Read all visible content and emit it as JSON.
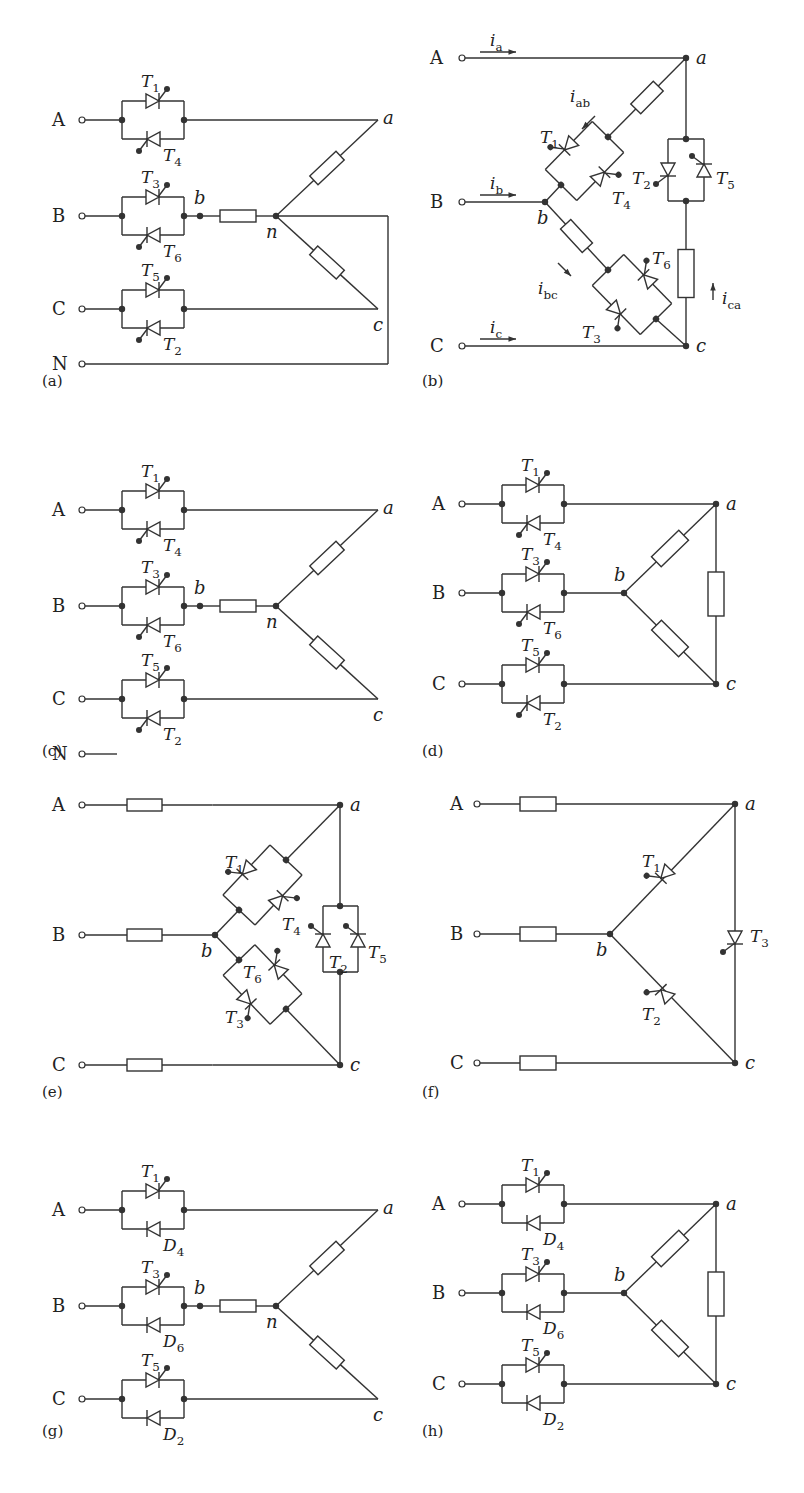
{
  "figure": {
    "stroke_color": "#333333",
    "background": "#ffffff"
  },
  "panels": [
    {
      "id": "a",
      "caption": "(a)",
      "x": 40,
      "y": 30,
      "type": "wye_series_neutral",
      "terminals": [
        "A",
        "B",
        "C",
        "N"
      ],
      "nodes": [
        "a",
        "b",
        "c",
        "n"
      ],
      "devices": [
        {
          "top": "T1",
          "bottom": "T4",
          "bottom_type": "thyristor"
        },
        {
          "top": "T3",
          "bottom": "T6",
          "bottom_type": "thyristor"
        },
        {
          "top": "T5",
          "bottom": "T2",
          "bottom_type": "thyristor"
        }
      ],
      "neutral_connected": true
    },
    {
      "id": "b",
      "caption": "(b)",
      "x": 420,
      "y": 30,
      "type": "delta_inside",
      "terminals": [
        "A",
        "B",
        "C"
      ],
      "nodes": [
        "a",
        "b",
        "c"
      ],
      "currents": [
        "ia",
        "ib",
        "ic",
        "iab",
        "ibc",
        "ica"
      ],
      "current_labels": {
        "ia": [
          "i",
          "a"
        ],
        "ib": [
          "i",
          "b"
        ],
        "ic": [
          "i",
          "c"
        ],
        "iab": [
          "i",
          "ab"
        ],
        "ibc": [
          "i",
          "bc"
        ],
        "ica": [
          "i",
          "ca"
        ]
      },
      "devices": {
        "ab": [
          "T1",
          "T4"
        ],
        "bc": [
          "T6",
          "T3"
        ],
        "ca": [
          "T2",
          "T5"
        ]
      }
    },
    {
      "id": "c",
      "caption": "(c)",
      "x": 40,
      "y": 420,
      "type": "wye_series_neutral",
      "terminals": [
        "A",
        "B",
        "C",
        "N"
      ],
      "nodes": [
        "a",
        "b",
        "c",
        "n"
      ],
      "devices": [
        {
          "top": "T1",
          "bottom": "T4",
          "bottom_type": "thyristor"
        },
        {
          "top": "T3",
          "bottom": "T6",
          "bottom_type": "thyristor"
        },
        {
          "top": "T5",
          "bottom": "T2",
          "bottom_type": "thyristor"
        }
      ],
      "neutral_connected": false
    },
    {
      "id": "d",
      "caption": "(d)",
      "x": 420,
      "y": 420,
      "type": "delta_series",
      "terminals": [
        "A",
        "B",
        "C"
      ],
      "nodes": [
        "a",
        "b",
        "c"
      ],
      "devices": [
        {
          "top": "T1",
          "bottom": "T4",
          "bottom_type": "thyristor"
        },
        {
          "top": "T3",
          "bottom": "T6",
          "bottom_type": "thyristor"
        },
        {
          "top": "T5",
          "bottom": "T2",
          "bottom_type": "thyristor"
        }
      ]
    },
    {
      "id": "e",
      "caption": "(e)",
      "x": 40,
      "y": 790,
      "type": "delta_inside_load_series",
      "terminals": [
        "A",
        "B",
        "C"
      ],
      "nodes": [
        "a",
        "b",
        "c"
      ],
      "devices": {
        "ab": [
          "T1",
          "T4"
        ],
        "bc": [
          "T6",
          "T3"
        ],
        "ca": [
          "T2",
          "T5"
        ]
      }
    },
    {
      "id": "f",
      "caption": "(f)",
      "x": 420,
      "y": 790,
      "type": "delta_single_thyristor",
      "terminals": [
        "A",
        "B",
        "C"
      ],
      "nodes": [
        "a",
        "b",
        "c"
      ],
      "devices": {
        "ab": "T1",
        "bc": "T2",
        "ca": "T3"
      }
    },
    {
      "id": "g",
      "caption": "(g)",
      "x": 40,
      "y": 1120,
      "type": "wye_series_neutral",
      "terminals": [
        "A",
        "B",
        "C"
      ],
      "nodes": [
        "a",
        "b",
        "c",
        "n"
      ],
      "devices": [
        {
          "top": "T1",
          "bottom": "D4",
          "bottom_type": "diode"
        },
        {
          "top": "T3",
          "bottom": "D6",
          "bottom_type": "diode"
        },
        {
          "top": "T5",
          "bottom": "D2",
          "bottom_type": "diode"
        }
      ],
      "neutral_connected": null
    },
    {
      "id": "h",
      "caption": "(h)",
      "x": 420,
      "y": 1120,
      "type": "delta_series",
      "terminals": [
        "A",
        "B",
        "C"
      ],
      "nodes": [
        "a",
        "b",
        "c"
      ],
      "devices": [
        {
          "top": "T1",
          "bottom": "D4",
          "bottom_type": "diode"
        },
        {
          "top": "T3",
          "bottom": "D6",
          "bottom_type": "diode"
        },
        {
          "top": "T5",
          "bottom": "D2",
          "bottom_type": "diode"
        }
      ]
    }
  ]
}
